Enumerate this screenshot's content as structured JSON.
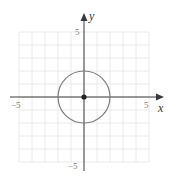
{
  "chart_data": {
    "type": "line",
    "title": "",
    "xlabel": "x",
    "ylabel": "y",
    "xlim": [
      -5,
      5
    ],
    "ylim": [
      -5,
      5
    ],
    "grid": true,
    "x_ticks": [
      {
        "value": -5,
        "label": "−5"
      },
      {
        "value": 5,
        "label": "5"
      }
    ],
    "y_ticks": [
      {
        "value": 5,
        "label": "5"
      },
      {
        "value": -5,
        "label": "−5"
      }
    ],
    "series": [
      {
        "name": "circle",
        "shape": "circle",
        "center": [
          0,
          0
        ],
        "radius": 2,
        "equation": "x^2 + y^2 = 4"
      },
      {
        "name": "center point",
        "shape": "point",
        "x": 0,
        "y": 0
      }
    ],
    "legend": null
  },
  "labels": {
    "x_axis": "x",
    "y_axis": "y",
    "x_min": "−5",
    "x_max": "5",
    "y_max": "5",
    "y_min": "−5"
  },
  "colors": {
    "grid": "#e4e4e4",
    "axis": "#3a3a3a",
    "circle": "#7d7d7d",
    "point": "#222222",
    "tick_label": "#7a7a7a"
  }
}
